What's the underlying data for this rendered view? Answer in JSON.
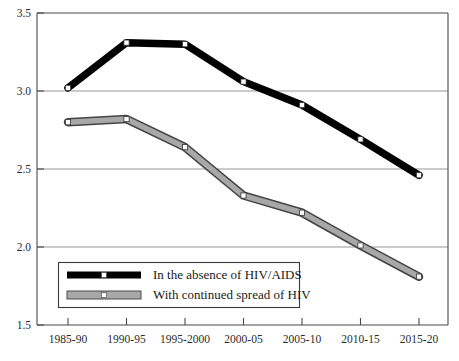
{
  "chart_data": {
    "type": "line",
    "title": "",
    "subtitle": "",
    "xlabel": "",
    "ylabel": "",
    "categories": [
      "1985-90",
      "1990-95",
      "1995-2000",
      "2000-05",
      "2005-10",
      "2010-15",
      "2015-20"
    ],
    "ylim": [
      1.5,
      3.5
    ],
    "yticks": [
      "1.5",
      "2.0",
      "2.5",
      "3.0",
      "3.5"
    ],
    "ytick_values": [
      1.5,
      2.0,
      2.5,
      3.0,
      3.5
    ],
    "grid": "horizontal",
    "legend_position": "bottom-left-inside",
    "series": [
      {
        "name": "In the absence of HIV/AIDS",
        "color": "#000000",
        "marker": "square-open",
        "values": [
          3.02,
          3.31,
          3.3,
          3.06,
          2.91,
          2.69,
          2.46
        ]
      },
      {
        "name": "With continued spread of HIV",
        "color": "#8c8c8c",
        "marker": "square-open",
        "values": [
          2.8,
          2.82,
          2.64,
          2.33,
          2.22,
          2.01,
          1.81
        ]
      }
    ]
  },
  "legend": {
    "entries": [
      {
        "label": "In the absence of HIV/AIDS"
      },
      {
        "label": "With continued spread of HIV"
      }
    ]
  }
}
